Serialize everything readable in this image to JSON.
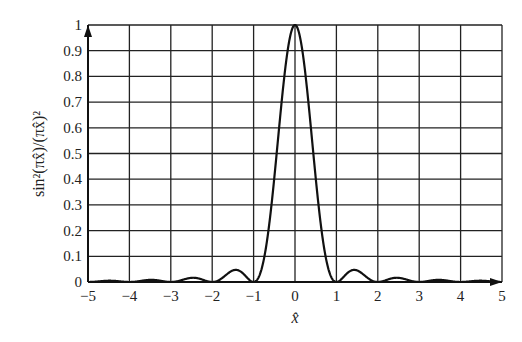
{
  "chart_data": {
    "type": "line",
    "title": "",
    "function": "sin^2(pi x)/(pi x)^2",
    "xlabel": "x̂",
    "ylabel": "sin²(πx̂)/(πx̂)²",
    "xlim": [
      -5,
      5
    ],
    "ylim": [
      0,
      1
    ],
    "x_ticks": [
      -5,
      -4,
      -3,
      -2,
      -1,
      0,
      1,
      2,
      3,
      4,
      5
    ],
    "x_tick_labels": [
      "−5",
      "−4",
      "−3",
      "−2",
      "−1",
      "0",
      "1",
      "2",
      "3",
      "4",
      "5"
    ],
    "y_ticks": [
      0,
      0.1,
      0.2,
      0.3,
      0.4,
      0.5,
      0.6,
      0.7,
      0.8,
      0.9,
      1
    ],
    "y_tick_labels": [
      "0",
      "0.1",
      "0.2",
      "0.3",
      "0.4",
      "0.5",
      "0.6",
      "0.7",
      "0.8",
      "0.9",
      "1"
    ],
    "grid": true,
    "legend": null,
    "series": [
      {
        "name": "sinc²",
        "x": [
          -5,
          -4.5,
          -4,
          -3.5,
          -3,
          -2.5,
          -2,
          -1.43,
          -1,
          -0.5,
          0,
          0.5,
          1,
          1.43,
          2,
          2.5,
          3,
          3.5,
          4,
          4.5,
          5
        ],
        "values": [
          0,
          0.005,
          0,
          0.008,
          0,
          0.016,
          0,
          0.047,
          0,
          0.405,
          1,
          0.405,
          0,
          0.047,
          0,
          0.016,
          0,
          0.008,
          0,
          0.005,
          0
        ]
      }
    ],
    "annotations": [
      "arrow on y-axis at top",
      "arrow on x-axis at right"
    ]
  },
  "layout": {
    "plot_left": 88,
    "plot_right": 502,
    "plot_top": 25,
    "plot_bottom": 282,
    "line_color": "#111111",
    "grid_color": "#222222"
  }
}
